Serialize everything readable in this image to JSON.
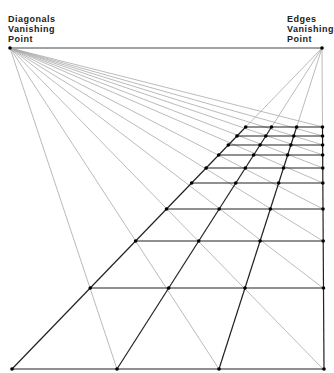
{
  "labels": {
    "diagonals_vp": [
      "Diagonals",
      "Vanishing",
      "Point"
    ],
    "edges_vp": [
      "Edges",
      "Vanishing",
      "Point"
    ]
  },
  "geometry": {
    "horizon_y": 48,
    "diagonals_vp": [
      10,
      48
    ],
    "edges_vp": [
      322,
      48
    ],
    "base_y": 369,
    "base_x": [
      12,
      117,
      219,
      324
    ],
    "row_y": [
      127,
      136,
      145,
      155,
      168,
      183,
      209,
      241,
      288,
      369
    ],
    "right_x": 323
  },
  "colors": {
    "grid": "#222222",
    "construction": "#aaaaaa",
    "horizon": "#444444"
  }
}
